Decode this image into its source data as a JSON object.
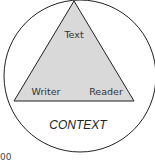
{
  "diagram": {
    "triangle": {
      "apex_label": "Text",
      "left_label": "Writer",
      "right_label": "Reader",
      "fill": "#d9d9d9",
      "stroke": "#222222"
    },
    "circle": {
      "label": "CONTEXT",
      "stroke": "#222222"
    },
    "fragment_text": "00"
  }
}
